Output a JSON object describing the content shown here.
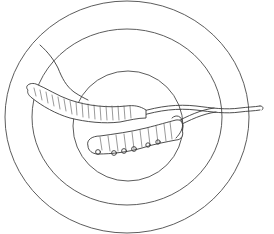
{
  "illustration": {
    "subject": "cordyceps specimens line drawing",
    "background": "#ffffff",
    "ink_color": "#3a3a3a",
    "rings": [
      {
        "name": "outer-ring",
        "cx": 127,
        "cy": 117,
        "rx": 122,
        "ry": 116
      },
      {
        "name": "middle-ring",
        "cx": 127,
        "cy": 117,
        "rx": 95,
        "ry": 88
      },
      {
        "name": "inner-ring",
        "cx": 128,
        "cy": 126,
        "rx": 55,
        "ry": 55
      }
    ],
    "specimens": [
      {
        "name": "upper-caterpillar",
        "description": "long segmented larva with stalk extending right"
      },
      {
        "name": "lower-caterpillar",
        "description": "shorter segmented larva with legs and stalk"
      }
    ],
    "annotation_line": {
      "from": [
        40,
        45
      ],
      "to": [
        88,
        100
      ]
    }
  }
}
